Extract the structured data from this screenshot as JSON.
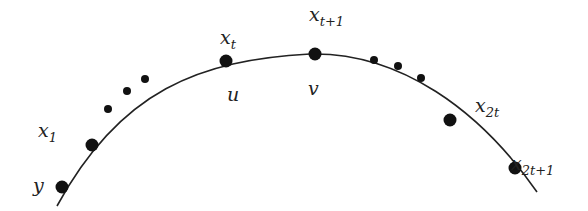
{
  "diagram": {
    "curve": {
      "path": "M 57 206 C 120 90, 200 60, 310 54 C 400 52, 480 110, 537 192"
    },
    "nodes": [
      {
        "id": "y",
        "cx": 62,
        "cy": 187,
        "r": 6.5
      },
      {
        "id": "x1",
        "cx": 92,
        "cy": 145,
        "r": 6.5
      },
      {
        "id": "xt",
        "cx": 226,
        "cy": 61,
        "r": 6.5
      },
      {
        "id": "xt1",
        "cx": 315,
        "cy": 54,
        "r": 6.5
      },
      {
        "id": "x2t",
        "cx": 450,
        "cy": 120,
        "r": 6.5
      },
      {
        "id": "x2t1",
        "cx": 515,
        "cy": 168,
        "r": 6.5
      }
    ],
    "ellipsis_left": [
      {
        "cx": 108,
        "cy": 109,
        "r": 4
      },
      {
        "cx": 127,
        "cy": 91,
        "r": 4
      },
      {
        "cx": 145,
        "cy": 79,
        "r": 4
      }
    ],
    "ellipsis_right": [
      {
        "cx": 374,
        "cy": 60,
        "r": 4
      },
      {
        "cx": 398,
        "cy": 66,
        "r": 4
      },
      {
        "cx": 421,
        "cy": 78,
        "r": 4
      }
    ],
    "labels": {
      "y": {
        "base": "y",
        "sub": ""
      },
      "x1": {
        "base": "x",
        "sub": "1"
      },
      "xt": {
        "base": "x",
        "sub": "t"
      },
      "u": {
        "base": "u",
        "sub": ""
      },
      "xt1": {
        "base": "x",
        "sub": "t+1"
      },
      "v": {
        "base": "v",
        "sub": ""
      },
      "x2t": {
        "base": "x",
        "sub": "2t"
      },
      "x2t1": {
        "base": "x",
        "sub": "2t+1"
      }
    }
  }
}
